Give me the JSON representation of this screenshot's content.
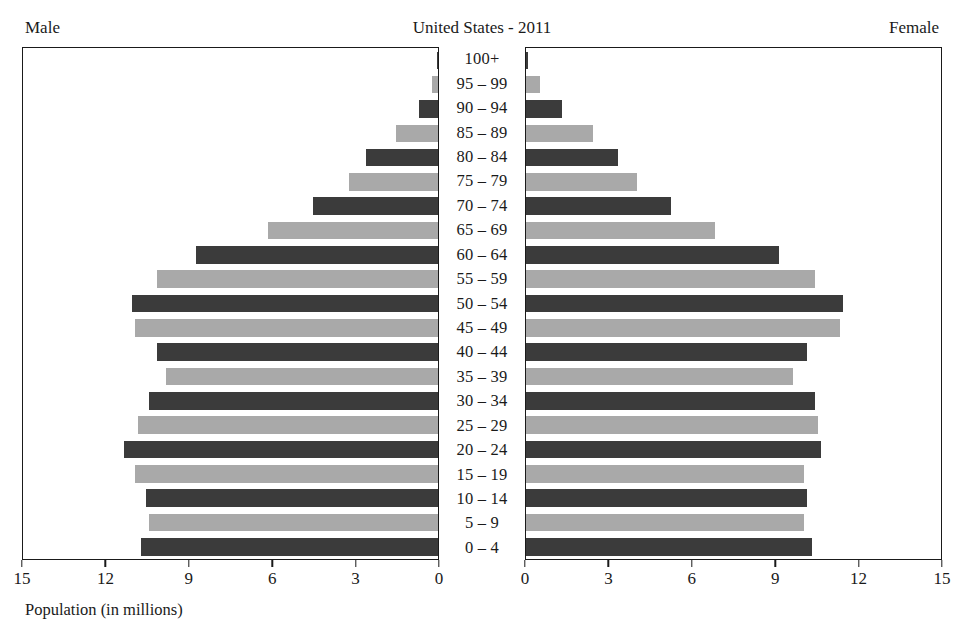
{
  "header": {
    "male_label": "Male",
    "title": "United States - 2011",
    "female_label": "Female"
  },
  "axis": {
    "caption": "Population (in millions)",
    "left_ticks": [
      "15",
      "12",
      "9",
      "6",
      "3",
      "0"
    ],
    "right_ticks": [
      "0",
      "3",
      "6",
      "9",
      "12",
      "15"
    ]
  },
  "colors": {
    "bar_dark": "#3b3b3b",
    "bar_light": "#a9a9a9",
    "frame": "#1a1a1a",
    "background": "#ffffff",
    "text": "#1a1a1a"
  },
  "chart_data": {
    "type": "bar",
    "title": "United States - 2011",
    "subtitle": "",
    "xlabel": "Population (in millions)",
    "ylabel": "",
    "xlim": [
      0,
      15
    ],
    "grid": false,
    "legend": "none",
    "orientation": "horizontal-diverging",
    "categories": [
      "0-4",
      "5-9",
      "10-14",
      "15-19",
      "20-24",
      "25-29",
      "30-34",
      "35-39",
      "40-44",
      "45-49",
      "50-54",
      "55-59",
      "60-64",
      "65-69",
      "70-74",
      "75-79",
      "80-84",
      "85-89",
      "90-94",
      "95-99",
      "100+"
    ],
    "series": [
      {
        "name": "Male",
        "side": "left",
        "values": [
          10.7,
          10.4,
          10.5,
          10.9,
          11.3,
          10.8,
          10.4,
          9.8,
          10.1,
          10.9,
          11.0,
          10.1,
          8.7,
          6.1,
          4.5,
          3.2,
          2.6,
          1.5,
          0.7,
          0.2,
          0.04
        ]
      },
      {
        "name": "Female",
        "side": "right",
        "values": [
          10.3,
          10.0,
          10.1,
          10.0,
          10.6,
          10.5,
          10.4,
          9.6,
          10.1,
          11.3,
          11.4,
          10.4,
          9.1,
          6.8,
          5.2,
          4.0,
          3.3,
          2.4,
          1.3,
          0.5,
          0.07
        ]
      }
    ],
    "bar_shades": [
      "dark",
      "light",
      "dark",
      "light",
      "dark",
      "light",
      "dark",
      "light",
      "dark",
      "light",
      "dark",
      "light",
      "dark",
      "light",
      "dark",
      "light",
      "dark",
      "light",
      "dark",
      "light",
      "dark"
    ]
  }
}
